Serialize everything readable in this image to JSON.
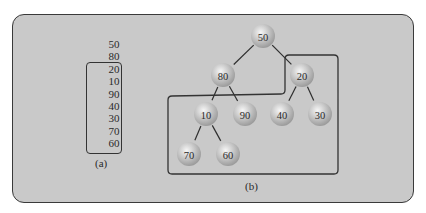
{
  "figure": {
    "part_a": {
      "label": "(a)",
      "items_outside": [
        "50",
        "80"
      ],
      "items_boxed": [
        "20",
        "10",
        "90",
        "40",
        "30",
        "70",
        "60"
      ]
    },
    "part_b": {
      "label": "(b)",
      "nodes": [
        {
          "id": "n50",
          "value": "50",
          "x": 263,
          "y": 36
        },
        {
          "id": "n80",
          "value": "80",
          "x": 223,
          "y": 75
        },
        {
          "id": "n20",
          "value": "20",
          "x": 302,
          "y": 75
        },
        {
          "id": "n10",
          "value": "10",
          "x": 206,
          "y": 114
        },
        {
          "id": "n90",
          "value": "90",
          "x": 245,
          "y": 114
        },
        {
          "id": "n40",
          "value": "40",
          "x": 282,
          "y": 114
        },
        {
          "id": "n30",
          "value": "30",
          "x": 320,
          "y": 114
        },
        {
          "id": "n70",
          "value": "70",
          "x": 189,
          "y": 154
        },
        {
          "id": "n60",
          "value": "60",
          "x": 228,
          "y": 154
        }
      ],
      "edges": [
        [
          "n50",
          "n80"
        ],
        [
          "n50",
          "n20"
        ],
        [
          "n80",
          "n10"
        ],
        [
          "n80",
          "n90"
        ],
        [
          "n20",
          "n40"
        ],
        [
          "n20",
          "n30"
        ],
        [
          "n10",
          "n70"
        ],
        [
          "n10",
          "n60"
        ]
      ]
    },
    "colors": {
      "background": "#c9c9c9",
      "border": "#3a3a3a",
      "node_highlight": "#f4f4f4",
      "node_shadow": "#9a9a9a"
    }
  }
}
